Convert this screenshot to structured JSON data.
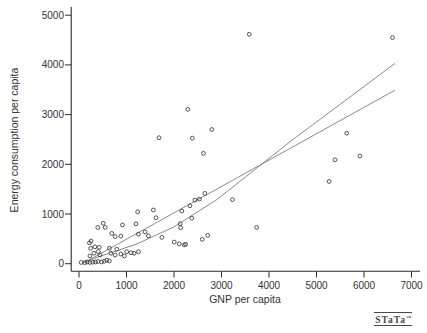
{
  "figure": {
    "background": "#ffffff",
    "watermark": {
      "text": "STaTa",
      "tm": "™"
    }
  },
  "chart_data": {
    "type": "scatter",
    "title": "",
    "xlabel": "GNP per capita",
    "ylabel": "Energy consumption per capita",
    "xlim": [
      0,
      7000
    ],
    "ylim": [
      0,
      5000
    ],
    "x_ticks": [
      0,
      1000,
      2000,
      3000,
      4000,
      5000,
      6000,
      7000
    ],
    "y_ticks": [
      0,
      1000,
      2000,
      3000,
      4000,
      5000
    ],
    "grid": false,
    "legend": "none",
    "marker": "open-circle",
    "marker_color": "#3f3f3f",
    "fit_line_color": "#7d7d7d",
    "axis_color": "#2b2b2b",
    "points": [
      [
        45,
        25
      ],
      [
        120,
        20
      ],
      [
        175,
        35
      ],
      [
        230,
        25
      ],
      [
        290,
        30
      ],
      [
        345,
        35
      ],
      [
        400,
        45
      ],
      [
        475,
        35
      ],
      [
        530,
        50
      ],
      [
        585,
        70
      ],
      [
        640,
        55
      ],
      [
        230,
        155
      ],
      [
        315,
        210
      ],
      [
        405,
        245
      ],
      [
        440,
        175
      ],
      [
        670,
        210
      ],
      [
        760,
        175
      ],
      [
        880,
        195
      ],
      [
        955,
        155
      ],
      [
        245,
        310
      ],
      [
        335,
        340
      ],
      [
        425,
        330
      ],
      [
        640,
        310
      ],
      [
        795,
        290
      ],
      [
        1005,
        240
      ],
      [
        1095,
        220
      ],
      [
        1160,
        210
      ],
      [
        1250,
        240
      ],
      [
        220,
        420
      ],
      [
        255,
        455
      ],
      [
        395,
        730
      ],
      [
        510,
        815
      ],
      [
        550,
        730
      ],
      [
        690,
        610
      ],
      [
        760,
        545
      ],
      [
        880,
        555
      ],
      [
        915,
        780
      ],
      [
        1200,
        800
      ],
      [
        1250,
        595
      ],
      [
        1390,
        640
      ],
      [
        1460,
        560
      ],
      [
        1745,
        530
      ],
      [
        2005,
        435
      ],
      [
        2110,
        400
      ],
      [
        2215,
        380
      ],
      [
        2245,
        390
      ],
      [
        2595,
        490
      ],
      [
        2710,
        570
      ],
      [
        2130,
        805
      ],
      [
        2140,
        725
      ],
      [
        3740,
        730
      ],
      [
        1235,
        1045
      ],
      [
        1565,
        1080
      ],
      [
        1620,
        925
      ],
      [
        2165,
        1060
      ],
      [
        2335,
        1165
      ],
      [
        2375,
        915
      ],
      [
        2440,
        1280
      ],
      [
        2535,
        1300
      ],
      [
        2650,
        1415
      ],
      [
        3230,
        1290
      ],
      [
        1685,
        2535
      ],
      [
        2290,
        3105
      ],
      [
        2385,
        2525
      ],
      [
        2620,
        2220
      ],
      [
        2795,
        2700
      ],
      [
        3585,
        4615
      ],
      [
        5265,
        1655
      ],
      [
        5390,
        2090
      ],
      [
        5635,
        2625
      ],
      [
        5915,
        2165
      ],
      [
        6600,
        4550
      ]
    ],
    "fit_lines": [
      {
        "shape": "straight",
        "points": [
          [
            90,
            10
          ],
          [
            6650,
            3490
          ]
        ]
      },
      {
        "shape": "curved",
        "points": [
          [
            90,
            30
          ],
          [
            600,
            200
          ],
          [
            1200,
            390
          ],
          [
            2000,
            740
          ],
          [
            2900,
            1290
          ],
          [
            3750,
            1930
          ],
          [
            4450,
            2460
          ],
          [
            5600,
            3280
          ],
          [
            6650,
            4030
          ]
        ]
      }
    ]
  }
}
